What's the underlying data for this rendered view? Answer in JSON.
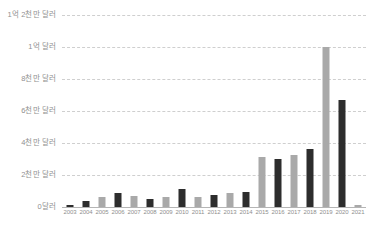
{
  "chart_data": {
    "type": "bar",
    "title": "",
    "xlabel": "",
    "ylabel": "",
    "categories": [
      "2003",
      "2004",
      "2005",
      "2006",
      "2007",
      "2008",
      "2009",
      "2010",
      "2011",
      "2012",
      "2013",
      "2014",
      "2015",
      "2016",
      "2017",
      "2018",
      "2019",
      "2020",
      "2021"
    ],
    "values": [
      1500000,
      3500000,
      6500000,
      9000000,
      7000000,
      5000000,
      6000000,
      11500000,
      6500000,
      7500000,
      9000000,
      9500000,
      31000000,
      30000000,
      32500000,
      36000000,
      100000000,
      67000000,
      1500000
    ],
    "value_labels": [
      "150만 달러",
      "350만 달러",
      "650만 달러",
      "900만 달러",
      "700만 달러",
      "500만 달러",
      "600만 달러",
      "1150만 달러",
      "650만 달러",
      "750만 달러",
      "900만 달러",
      "950만 달러",
      "3100만 달러",
      "3000만 달러",
      "3250만 달러",
      "3600만 달러",
      "1억 달러",
      "6700만 달러",
      "150만 달러"
    ],
    "bar_colors": [
      "#2d2d2d",
      "#2d2d2d",
      "#a9a9a9",
      "#2d2d2d",
      "#a9a9a9",
      "#2d2d2d",
      "#a9a9a9",
      "#2d2d2d",
      "#a9a9a9",
      "#2d2d2d",
      "#a9a9a9",
      "#2d2d2d",
      "#a9a9a9",
      "#2d2d2d",
      "#a9a9a9",
      "#2d2d2d",
      "#a9a9a9",
      "#2d2d2d",
      "#a9a9a9"
    ],
    "ylim": [
      0,
      120000000
    ],
    "yticks": [
      0,
      20000000,
      40000000,
      60000000,
      80000000,
      100000000,
      120000000
    ],
    "ytick_labels": [
      "0달러",
      "2천만 달러",
      "4천만 달러",
      "6천만 달러",
      "8천만 달러",
      "1억 달러",
      "1억 2천만 달러"
    ],
    "grid": true,
    "grid_style": "dashed",
    "grid_color": "#cfcfcf",
    "legend": "none",
    "legend_position": "none",
    "axis_label_color": "#8f8f8f",
    "background_color": "#ffffff",
    "colors": {
      "dark_bar": "#2d2d2d",
      "light_bar": "#a9a9a9",
      "gridline": "#cfcfcf",
      "baseline": "#b5b5b5",
      "text": "#8f8f8f"
    }
  }
}
